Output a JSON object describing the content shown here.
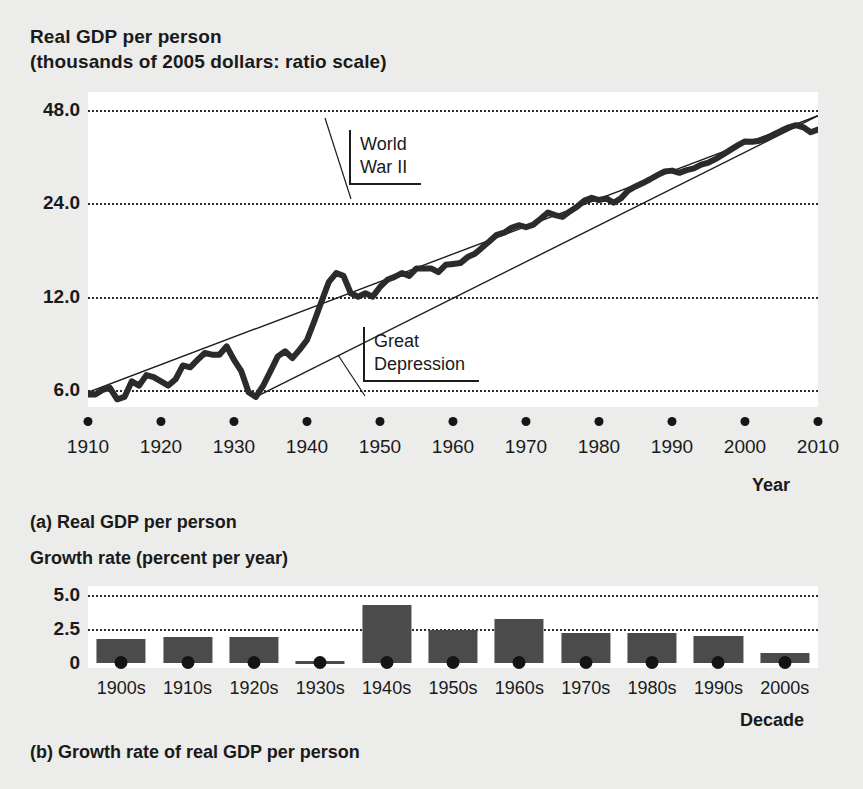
{
  "panel_a": {
    "title_line1": "Real GDP per person",
    "title_line2": "(thousands of 2005 dollars: ratio scale)",
    "caption": "(a) Real GDP per person",
    "x_axis_name": "Year",
    "annotations": [
      {
        "name": "world-war-2",
        "line1": "World",
        "line2": "War II"
      },
      {
        "name": "great-depression",
        "line1": "Great",
        "line2": "Depression"
      }
    ]
  },
  "panel_b": {
    "title": "Growth rate (percent per year)",
    "caption": "(b) Growth rate of real GDP per person",
    "x_axis_name": "Decade"
  },
  "colors": {
    "page_background": "#ececeb",
    "plot_background": "#ffffff",
    "series_line": "#2b2b2b",
    "trend_line": "#1d1d1d",
    "bar_fill": "#4b4b4b",
    "gridline": "#2b2b2b",
    "text": "#1a1a1a"
  },
  "chart_data": [
    {
      "type": "line",
      "name": "real-gdp-per-person",
      "title": "Real GDP per person (thousands of 2005 dollars: ratio scale)",
      "xlabel": "Year",
      "ylabel": "Real GDP per person (thousands of 2005 dollars)",
      "yscale": "log",
      "ylim": [
        5.0,
        55.0
      ],
      "xlim": [
        1910,
        2010
      ],
      "grid": true,
      "yticks": [
        6.0,
        12.0,
        24.0,
        48.0
      ],
      "ytick_labels": [
        "6.0",
        "12.0",
        "24.0",
        "48.0"
      ],
      "xticks": [
        1910,
        1920,
        1930,
        1940,
        1950,
        1960,
        1970,
        1980,
        1990,
        2000,
        2010
      ],
      "xtick_labels": [
        "1910",
        "1920",
        "1930",
        "1940",
        "1950",
        "1960",
        "1970",
        "1980",
        "1990",
        "2000",
        "2010"
      ],
      "annotations": [
        {
          "text": "World War II",
          "points_to_year": 1943
        },
        {
          "text": "Great Depression",
          "points_to_year": 1933
        }
      ],
      "trend_lines": [
        {
          "name": "long-run-trend",
          "from": [
            1910,
            5.9
          ],
          "to": [
            2010,
            46.0
          ]
        },
        {
          "name": "post-depression-trend",
          "from": [
            1933,
            5.7
          ],
          "to": [
            2010,
            46.0
          ]
        }
      ],
      "x": [
        1910,
        1911,
        1912,
        1913,
        1914,
        1915,
        1916,
        1917,
        1918,
        1919,
        1920,
        1921,
        1922,
        1923,
        1924,
        1925,
        1926,
        1927,
        1928,
        1929,
        1930,
        1931,
        1932,
        1933,
        1934,
        1935,
        1936,
        1937,
        1938,
        1939,
        1940,
        1941,
        1942,
        1943,
        1944,
        1945,
        1946,
        1947,
        1948,
        1949,
        1950,
        1951,
        1952,
        1953,
        1954,
        1955,
        1956,
        1957,
        1958,
        1959,
        1960,
        1961,
        1962,
        1963,
        1964,
        1965,
        1966,
        1967,
        1968,
        1969,
        1970,
        1971,
        1972,
        1973,
        1974,
        1975,
        1976,
        1977,
        1978,
        1979,
        1980,
        1981,
        1982,
        1983,
        1984,
        1985,
        1986,
        1987,
        1988,
        1989,
        1990,
        1991,
        1992,
        1993,
        1994,
        1995,
        1996,
        1997,
        1998,
        1999,
        2000,
        2001,
        2002,
        2003,
        2004,
        2005,
        2006,
        2007,
        2008,
        2009,
        2010
      ],
      "y": [
        5.8,
        5.8,
        6.0,
        6.1,
        5.6,
        5.7,
        6.4,
        6.2,
        6.7,
        6.6,
        6.4,
        6.2,
        6.5,
        7.2,
        7.1,
        7.5,
        7.9,
        7.8,
        7.8,
        8.3,
        7.5,
        6.9,
        5.9,
        5.7,
        6.2,
        6.9,
        7.7,
        8.0,
        7.6,
        8.1,
        8.7,
        10.0,
        11.6,
        13.4,
        14.3,
        14.0,
        12.3,
        12.0,
        12.3,
        12.0,
        12.9,
        13.6,
        13.9,
        14.3,
        14.0,
        14.8,
        14.8,
        14.8,
        14.4,
        15.2,
        15.3,
        15.4,
        16.1,
        16.5,
        17.3,
        18.1,
        19.0,
        19.3,
        20.0,
        20.4,
        20.1,
        20.5,
        21.4,
        22.4,
        22.0,
        21.7,
        22.6,
        23.4,
        24.5,
        25.0,
        24.6,
        24.9,
        24.1,
        24.9,
        26.4,
        27.2,
        27.9,
        28.7,
        29.6,
        30.4,
        30.6,
        30.1,
        30.7,
        31.1,
        32.0,
        32.5,
        33.4,
        34.5,
        35.7,
        36.9,
        38.0,
        37.9,
        38.2,
        38.9,
        40.1,
        41.2,
        42.2,
        42.9,
        42.2,
        40.7,
        41.5
      ]
    },
    {
      "type": "bar",
      "name": "growth-rate-of-real-gdp-per-person",
      "title": "Growth rate (percent per year)",
      "xlabel": "Decade",
      "ylabel": "Growth rate (percent per year)",
      "ylim": [
        0,
        5.6
      ],
      "grid": true,
      "yticks": [
        0,
        2.5,
        5.0
      ],
      "ytick_labels": [
        "0",
        "2.5",
        "5.0"
      ],
      "categories": [
        "1900s",
        "1910s",
        "1920s",
        "1930s",
        "1940s",
        "1950s",
        "1960s",
        "1970s",
        "1980s",
        "1990s",
        "2000s"
      ],
      "values": [
        1.8,
        1.9,
        1.9,
        0.15,
        4.3,
        2.4,
        3.2,
        2.2,
        2.2,
        2.0,
        0.7
      ]
    }
  ]
}
